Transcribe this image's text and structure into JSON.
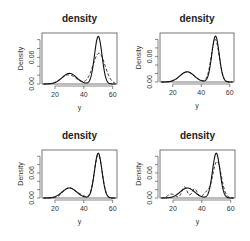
{
  "chart_data": [
    {
      "type": "line",
      "title": "density",
      "xlabel": "y",
      "ylabel": "Density",
      "xlim": [
        11,
        63
      ],
      "ylim": [
        0,
        0.115
      ],
      "xticks": [
        20,
        40,
        60
      ],
      "yticks": [
        0.0,
        0.02,
        0.04,
        0.06,
        0.08,
        0.1
      ],
      "ytick_labels": [
        {
          "value": 0.0,
          "label": "0.00"
        },
        {
          "value": 0.06,
          "label": "0.06"
        }
      ],
      "grid": false,
      "series": [
        {
          "name": "true density",
          "style": "solid",
          "components": [
            {
              "w": 0.3,
              "mu": 30,
              "sd": 5
            },
            {
              "w": 0.7,
              "mu": 50,
              "sd": 2.6
            }
          ]
        },
        {
          "name": "estimate",
          "style": "dashed",
          "components": [
            {
              "w": 0.27,
              "mu": 29.5,
              "sd": 5.2
            },
            {
              "w": 0.73,
              "mu": 50.5,
              "sd": 4.2
            }
          ]
        }
      ]
    },
    {
      "type": "line",
      "title": "density",
      "xlabel": "y",
      "ylabel": "Density",
      "xlim": [
        11,
        63
      ],
      "ylim": [
        0,
        0.115
      ],
      "xticks": [
        20,
        40,
        60
      ],
      "yticks": [
        0.0,
        0.02,
        0.04,
        0.06,
        0.08,
        0.1
      ],
      "ytick_labels": [
        {
          "value": 0.0,
          "label": "0.00"
        },
        {
          "value": 0.06,
          "label": "0.06"
        }
      ],
      "grid": false,
      "series": [
        {
          "name": "true density",
          "style": "solid",
          "components": [
            {
              "w": 0.3,
              "mu": 30,
              "sd": 5
            },
            {
              "w": 0.7,
              "mu": 50,
              "sd": 2.6
            }
          ]
        },
        {
          "name": "estimate",
          "style": "dashed",
          "components": [
            {
              "w": 0.3,
              "mu": 30.2,
              "sd": 5.1
            },
            {
              "w": 0.7,
              "mu": 49.8,
              "sd": 2.8
            }
          ]
        }
      ]
    },
    {
      "type": "line",
      "title": "density",
      "xlabel": "y",
      "ylabel": "Density",
      "xlim": [
        11,
        63
      ],
      "ylim": [
        0,
        0.115
      ],
      "xticks": [
        20,
        40,
        60
      ],
      "yticks": [
        0.0,
        0.02,
        0.04,
        0.06,
        0.08,
        0.1
      ],
      "ytick_labels": [
        {
          "value": 0.0,
          "label": "0.00"
        },
        {
          "value": 0.06,
          "label": "0.06"
        }
      ],
      "grid": false,
      "series": [
        {
          "name": "true density",
          "style": "solid",
          "components": [
            {
              "w": 0.3,
              "mu": 30,
              "sd": 5
            },
            {
              "w": 0.7,
              "mu": 50,
              "sd": 2.6
            }
          ]
        },
        {
          "name": "estimate",
          "style": "dashed",
          "components": [
            {
              "w": 0.16,
              "mu": 28.5,
              "sd": 3.6
            },
            {
              "w": 0.14,
              "mu": 34,
              "sd": 4.5
            },
            {
              "w": 0.7,
              "mu": 50,
              "sd": 2.7
            }
          ]
        }
      ]
    },
    {
      "type": "line",
      "title": "density",
      "xlabel": "y",
      "ylabel": "Density",
      "xlim": [
        11,
        63
      ],
      "ylim": [
        0,
        0.115
      ],
      "xticks": [
        20,
        40,
        60
      ],
      "yticks": [
        0.0,
        0.02,
        0.04,
        0.06,
        0.08,
        0.1
      ],
      "ytick_labels": [
        {
          "value": 0.0,
          "label": "0.00"
        },
        {
          "value": 0.06,
          "label": "0.06"
        }
      ],
      "grid": false,
      "series": [
        {
          "name": "true density",
          "style": "solid",
          "components": [
            {
              "w": 0.3,
              "mu": 30,
              "sd": 5
            },
            {
              "w": 0.7,
              "mu": 50,
              "sd": 2.6
            }
          ]
        },
        {
          "name": "estimate",
          "style": "dashed",
          "components": [
            {
              "w": 0.06,
              "mu": 19,
              "sd": 2.5
            },
            {
              "w": 0.12,
              "mu": 28,
              "sd": 1.8
            },
            {
              "w": 0.1,
              "mu": 35,
              "sd": 1.8
            },
            {
              "w": 0.06,
              "mu": 43,
              "sd": 2
            },
            {
              "w": 0.66,
              "mu": 50.5,
              "sd": 3
            }
          ]
        }
      ]
    }
  ]
}
